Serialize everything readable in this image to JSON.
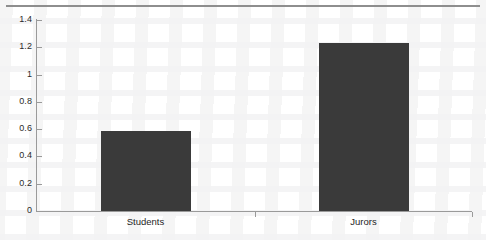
{
  "chart_data": {
    "type": "bar",
    "title": "",
    "subtitle": "",
    "xlabel": "",
    "ylabel": "",
    "categories": [
      "Students",
      "Jurors"
    ],
    "values": [
      0.585,
      1.235
    ],
    "series": [
      {
        "name": "",
        "values": [
          0.585,
          1.235
        ]
      }
    ],
    "ylim": [
      0,
      1.4
    ],
    "ytick_labels": [
      "0",
      "0.2",
      "0.4",
      "0.6",
      "0.8",
      "1",
      "1.2",
      "1.4"
    ],
    "ytick_values": [
      0,
      0.2,
      0.4,
      0.6,
      0.8,
      1,
      1.2,
      1.4
    ],
    "grid": false,
    "legend": "none",
    "bar_color": "#3a3a3a",
    "axis_color": "#9a9a9a",
    "background_color": "#ffffff"
  },
  "figure": {
    "page_rule_name": "top-page-rule"
  }
}
